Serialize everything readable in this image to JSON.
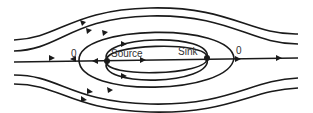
{
  "diagram": {
    "type": "flow-streamlines",
    "labels": {
      "source": "Source",
      "sink": "Sink",
      "stagnation_left": "0",
      "stagnation_right": "0"
    },
    "colors": {
      "line": "#1a1a1a",
      "text": "#333333",
      "background": "#ffffff"
    }
  }
}
